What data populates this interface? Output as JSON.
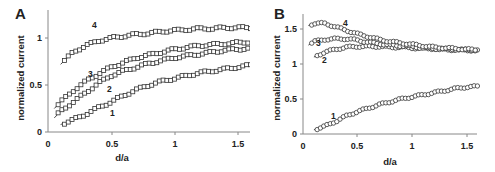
{
  "chart_data": [
    {
      "panel": "A",
      "type": "scatter",
      "marker": "square",
      "title": "",
      "xlabel": "d/a",
      "ylabel": "normalized current",
      "xlim": [
        0,
        1.6
      ],
      "ylim": [
        0,
        1.25
      ],
      "xticks": [
        "0",
        "0.5",
        "1",
        "1.5"
      ],
      "yticks": [
        "0",
        "0.5",
        "1"
      ],
      "grid": false,
      "fit_lines": true,
      "series": [
        {
          "name": "1",
          "x": [
            0.1,
            0.2,
            0.3,
            0.4,
            0.5,
            0.6,
            0.7,
            0.8,
            0.9,
            1.0,
            1.1,
            1.2,
            1.3,
            1.4,
            1.5,
            1.6
          ],
          "values": [
            0.08,
            0.13,
            0.19,
            0.26,
            0.32,
            0.39,
            0.45,
            0.5,
            0.54,
            0.57,
            0.6,
            0.63,
            0.65,
            0.67,
            0.69,
            0.71
          ]
        },
        {
          "name": "2",
          "x": [
            0.05,
            0.1,
            0.2,
            0.3,
            0.4,
            0.5,
            0.6,
            0.7,
            0.8,
            0.9,
            1.0,
            1.1,
            1.2,
            1.3,
            1.4,
            1.5,
            1.6
          ],
          "values": [
            0.15,
            0.22,
            0.32,
            0.42,
            0.52,
            0.6,
            0.65,
            0.69,
            0.73,
            0.76,
            0.79,
            0.81,
            0.83,
            0.85,
            0.87,
            0.88,
            0.89
          ]
        },
        {
          "name": "3",
          "x": [
            0.05,
            0.1,
            0.2,
            0.3,
            0.4,
            0.5,
            0.6,
            0.7,
            0.8,
            0.9,
            1.0,
            1.1,
            1.2,
            1.3,
            1.4,
            1.5,
            1.6
          ],
          "values": [
            0.25,
            0.32,
            0.44,
            0.54,
            0.62,
            0.69,
            0.74,
            0.79,
            0.82,
            0.85,
            0.88,
            0.9,
            0.92,
            0.93,
            0.94,
            0.95,
            0.96
          ]
        },
        {
          "name": "4",
          "x": [
            0.1,
            0.2,
            0.3,
            0.4,
            0.5,
            0.6,
            0.7,
            0.8,
            0.9,
            1.0,
            1.1,
            1.2,
            1.3,
            1.4,
            1.5,
            1.6
          ],
          "values": [
            0.72,
            0.85,
            0.92,
            0.97,
            1.0,
            1.02,
            1.04,
            1.05,
            1.07,
            1.08,
            1.09,
            1.1,
            1.1,
            1.11,
            1.11,
            1.11
          ]
        }
      ]
    },
    {
      "panel": "B",
      "type": "scatter",
      "marker": "circle",
      "title": "",
      "xlabel": "d/a",
      "ylabel": "normalized current",
      "xlim": [
        0,
        1.6
      ],
      "ylim": [
        0,
        1.7
      ],
      "xticks": [
        "0",
        "0.5",
        "1",
        "1.5"
      ],
      "yticks": [
        "0",
        "0.5",
        "1",
        "1.5"
      ],
      "grid": false,
      "fit_lines": true,
      "series": [
        {
          "name": "1",
          "x": [
            0.1,
            0.2,
            0.3,
            0.4,
            0.5,
            0.6,
            0.7,
            0.8,
            0.9,
            1.0,
            1.1,
            1.2,
            1.3,
            1.4,
            1.5,
            1.6
          ],
          "values": [
            0.06,
            0.11,
            0.18,
            0.26,
            0.32,
            0.37,
            0.42,
            0.46,
            0.5,
            0.53,
            0.56,
            0.59,
            0.62,
            0.65,
            0.67,
            0.68
          ]
        },
        {
          "name": "2",
          "x": [
            0.1,
            0.2,
            0.3,
            0.4,
            0.5,
            0.6,
            0.7,
            0.8,
            0.9,
            1.0,
            1.1,
            1.2,
            1.3,
            1.4,
            1.5,
            1.6
          ],
          "values": [
            1.1,
            1.17,
            1.21,
            1.24,
            1.25,
            1.25,
            1.25,
            1.24,
            1.24,
            1.23,
            1.22,
            1.22,
            1.21,
            1.2,
            1.2,
            1.19
          ]
        },
        {
          "name": "3",
          "x": [
            0.05,
            0.1,
            0.2,
            0.3,
            0.4,
            0.5,
            0.6,
            0.7,
            0.8,
            0.9,
            1.0,
            1.1,
            1.2,
            1.3,
            1.4,
            1.5,
            1.6
          ],
          "values": [
            1.27,
            1.32,
            1.35,
            1.36,
            1.36,
            1.34,
            1.31,
            1.29,
            1.27,
            1.26,
            1.25,
            1.23,
            1.22,
            1.21,
            1.21,
            1.2,
            1.2
          ]
        },
        {
          "name": "4",
          "x": [
            0.05,
            0.1,
            0.2,
            0.3,
            0.4,
            0.5,
            0.6,
            0.7,
            0.8,
            0.9,
            1.0,
            1.1,
            1.2,
            1.3,
            1.4,
            1.5,
            1.6
          ],
          "values": [
            1.55,
            1.58,
            1.58,
            1.53,
            1.48,
            1.43,
            1.39,
            1.35,
            1.32,
            1.3,
            1.28,
            1.26,
            1.24,
            1.23,
            1.22,
            1.21,
            1.2
          ]
        }
      ]
    }
  ],
  "panels": {
    "a": {
      "label": "A",
      "xlabel": "d/a",
      "ylabel": "normalized current",
      "xticks": [
        "0",
        "0.5",
        "1",
        "1.5"
      ],
      "yticks": [
        "0",
        "0.5",
        "1"
      ]
    },
    "b": {
      "label": "B",
      "xlabel": "d/a",
      "ylabel": "normalized current",
      "xticks": [
        "0",
        "0.5",
        "1",
        "1.5"
      ],
      "yticks": [
        "0",
        "0.5",
        "1",
        "1.5"
      ]
    }
  }
}
